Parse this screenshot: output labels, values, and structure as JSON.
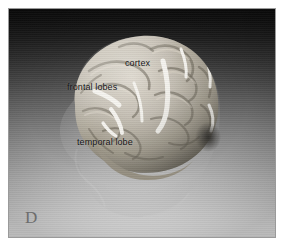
{
  "figure": {
    "panel_letter": "D",
    "modality": "3d-brain-surface-rendering"
  },
  "image": {
    "frame_border_color": "#9a9a9a",
    "page_background": "#ffffff",
    "background_top_color": "#0a0a0a",
    "background_bottom_color": "#ebebeb",
    "background_direction": "vertical-gradient-dark-to-light",
    "brain_surface_color": "#b6b0a6",
    "brain_shadow_color": "#4a463f",
    "highlight_marker_color": "#f2f0ea",
    "label_text_color": "#141414",
    "panel_letter_color": "#6d6d6d"
  },
  "labels": [
    {
      "id": "cortex",
      "text": "cortex"
    },
    {
      "id": "frontal-lobes",
      "text": "frontal lobes"
    },
    {
      "id": "temporal-lobe",
      "text": "temporal lobe"
    }
  ]
}
